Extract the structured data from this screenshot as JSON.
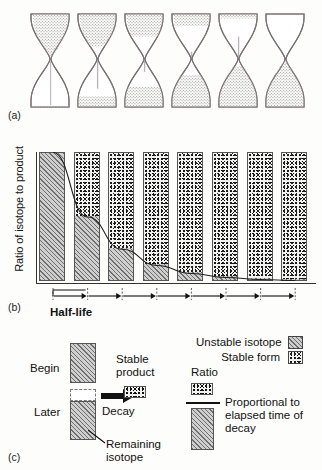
{
  "figure": {
    "panel_a": {
      "tag": "(a)",
      "hourglasses": [
        {
          "name": "hourglass-1",
          "top_fill": 1.0,
          "bottom_fill": 0.02
        },
        {
          "name": "hourglass-2",
          "top_fill": 0.72,
          "bottom_fill": 0.22
        },
        {
          "name": "hourglass-3",
          "top_fill": 0.5,
          "bottom_fill": 0.42
        },
        {
          "name": "hourglass-4",
          "top_fill": 0.26,
          "bottom_fill": 0.66
        },
        {
          "name": "hourglass-5",
          "top_fill": 0.1,
          "bottom_fill": 0.84
        },
        {
          "name": "hourglass-6",
          "top_fill": 0.0,
          "bottom_fill": 0.96
        }
      ]
    },
    "panel_b": {
      "tag": "(b)",
      "ylabel": "Ratio of isotope to product",
      "halflife_label": "Half-life",
      "halflife_intervals": 7
    },
    "panel_c": {
      "tag": "(c)",
      "begin_label": "Begin",
      "later_label": "Later",
      "decay_label": "Decay",
      "stable_product_label_line1": "Stable",
      "stable_product_label_line2": "product",
      "remaining_isotope_label_line1": "Remaining",
      "remaining_isotope_label_line2": "isotope",
      "ratio_label": "Ratio",
      "proportional_line1": "Proportional to",
      "proportional_line2": "elapsed time of",
      "proportional_line3": "decay"
    },
    "legend": {
      "unstable_label": "Unstable isotope",
      "stable_label": "Stable form"
    },
    "colors": {
      "ink": "#1a1a1a",
      "axis": "#333333",
      "isotope_fill": "#c9c9c9",
      "isotope_hatch": "#6e6e6e",
      "stable_fill": "#f2f2f0",
      "stable_dots": "#111111",
      "page": "#fdfdfc"
    }
  },
  "chart_data": {
    "type": "bar",
    "title": "",
    "xlabel": "Half-life",
    "ylabel": "Ratio of isotope to product",
    "grid": false,
    "legend_position": "right-below",
    "categories": [
      "0",
      "1",
      "2",
      "3",
      "4",
      "5",
      "6",
      "7"
    ],
    "x_unit": "half-lives elapsed",
    "ylim": [
      0,
      100
    ],
    "y_unit": "percent of sample",
    "stacked": true,
    "series": [
      {
        "name": "Unstable isotope",
        "pattern": "diagonal-hatch",
        "values": [
          100,
          50,
          25,
          12.5,
          6.25,
          3.13,
          1.56,
          0.78
        ]
      },
      {
        "name": "Stable form",
        "pattern": "stipple-dots",
        "values": [
          0,
          50,
          75,
          87.5,
          93.75,
          96.87,
          98.44,
          99.22
        ]
      }
    ],
    "decay_curve": {
      "name": "Remaining isotope fraction",
      "x": [
        0,
        1,
        2,
        3,
        4,
        5,
        6,
        7
      ],
      "y": [
        100,
        50,
        25,
        12.5,
        6.25,
        3.13,
        1.56,
        0.78
      ]
    },
    "annotations": [
      {
        "text": "Half-life",
        "kind": "interval-bracket",
        "x_start": 0,
        "x_end": 1
      }
    ]
  }
}
